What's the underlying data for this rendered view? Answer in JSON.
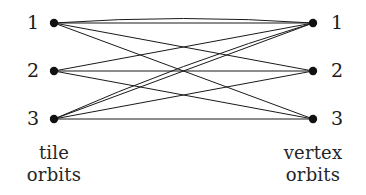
{
  "figure": {
    "type": "bipartite-graph",
    "background_color": "#ffffff",
    "edge_color": "#1a1a1a",
    "node_color": "#111111",
    "node_radius": 4.2,
    "edge_width": 1.0
  },
  "left": {
    "caption_line1": "tile",
    "caption_line2": "orbits",
    "x": 54,
    "nodes": [
      {
        "label": "1",
        "y": 23
      },
      {
        "label": "2",
        "y": 71
      },
      {
        "label": "3",
        "y": 119
      }
    ]
  },
  "right": {
    "caption_line1": "vertex",
    "caption_line2": "orbits",
    "x": 313,
    "nodes": [
      {
        "label": "1",
        "y": 23
      },
      {
        "label": "2",
        "y": 71
      },
      {
        "label": "3",
        "y": 119
      }
    ]
  },
  "edges": [
    {
      "from": 0,
      "to": 0
    },
    {
      "from": 0,
      "to": 1
    },
    {
      "from": 0,
      "to": 2
    },
    {
      "from": 1,
      "to": 0
    },
    {
      "from": 1,
      "to": 1
    },
    {
      "from": 1,
      "to": 2
    },
    {
      "from": 2,
      "to": 0
    },
    {
      "from": 2,
      "to": 1
    },
    {
      "from": 2,
      "to": 2
    },
    {
      "from": 0,
      "to": 0
    },
    {
      "from": 2,
      "to": 0
    }
  ],
  "chart_data": {
    "type": "diagram",
    "title": "",
    "left_nodes": [
      "1",
      "2",
      "3"
    ],
    "right_nodes": [
      "1",
      "2",
      "3"
    ],
    "left_axis_label": "tile orbits",
    "right_axis_label": "vertex orbits",
    "edge_list": [
      [
        "1",
        "1"
      ],
      [
        "1",
        "2"
      ],
      [
        "1",
        "3"
      ],
      [
        "2",
        "1"
      ],
      [
        "2",
        "2"
      ],
      [
        "2",
        "3"
      ],
      [
        "3",
        "1"
      ],
      [
        "3",
        "2"
      ],
      [
        "3",
        "3"
      ],
      [
        "1",
        "1"
      ],
      [
        "3",
        "1"
      ]
    ],
    "edge_count": 11,
    "left_degrees": [
      4,
      3,
      4
    ],
    "right_degrees": [
      5,
      3,
      3
    ]
  }
}
